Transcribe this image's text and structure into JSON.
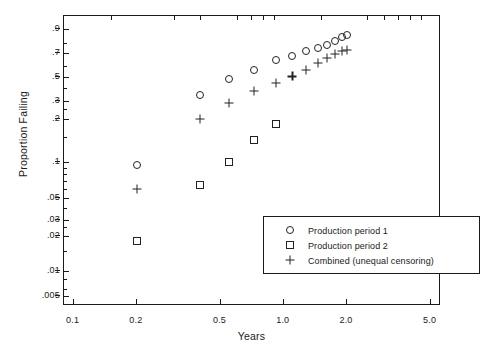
{
  "chart_data": {
    "type": "scatter",
    "title": "",
    "xlabel": "Years",
    "ylabel": "Proportion Failing",
    "xscale": "log",
    "yscale": "log-probability",
    "xlim": [
      0.09,
      5.6
    ],
    "ylim": [
      0.004,
      0.96
    ],
    "grid": false,
    "legend_position": "lower-right-inside",
    "xticks": [
      "0.1",
      "0.2",
      "0.5",
      "1.0",
      "2.0",
      "5.0"
    ],
    "xtick_values": [
      0.1,
      0.2,
      0.5,
      1.0,
      2.0,
      5.0
    ],
    "yticks": [
      ".9",
      ".7",
      ".5",
      ".3",
      ".2",
      ".1",
      ".05",
      ".03",
      ".02",
      ".01",
      ".005"
    ],
    "ytick_values": [
      0.9,
      0.7,
      0.5,
      0.3,
      0.2,
      0.1,
      0.05,
      0.03,
      0.02,
      0.01,
      0.005
    ],
    "series": [
      {
        "name": "Production period 1",
        "marker": "circle",
        "points": [
          [
            0.2,
            0.095
          ],
          [
            0.4,
            0.35
          ],
          [
            0.55,
            0.48
          ],
          [
            0.72,
            0.56
          ],
          [
            0.92,
            0.645
          ],
          [
            1.1,
            0.68
          ],
          [
            1.28,
            0.72
          ],
          [
            1.45,
            0.755
          ],
          [
            1.6,
            0.785
          ],
          [
            1.75,
            0.82
          ],
          [
            1.9,
            0.855
          ],
          [
            2.0,
            0.865
          ]
        ]
      },
      {
        "name": "Production period 2",
        "marker": "square",
        "points": [
          [
            0.2,
            0.018
          ],
          [
            0.4,
            0.065
          ],
          [
            0.55,
            0.1
          ],
          [
            0.72,
            0.145
          ],
          [
            0.92,
            0.185
          ]
        ]
      },
      {
        "name": "Combined (unequal censoring)",
        "marker": "plus",
        "points": [
          [
            0.2,
            0.06
          ],
          [
            0.4,
            0.2
          ],
          [
            0.55,
            0.29
          ],
          [
            0.72,
            0.38
          ],
          [
            0.92,
            0.45
          ],
          [
            1.1,
            0.505
          ],
          [
            1.28,
            0.565
          ],
          [
            1.45,
            0.625
          ],
          [
            1.6,
            0.66
          ],
          [
            1.75,
            0.695
          ],
          [
            1.9,
            0.72
          ],
          [
            2.0,
            0.73
          ]
        ]
      }
    ]
  },
  "legend": {
    "entries": [
      {
        "marker": "circle",
        "label": "Production period 1"
      },
      {
        "marker": "square",
        "label": "Production period 2"
      },
      {
        "marker": "plus",
        "label": "Combined (unequal censoring)"
      }
    ]
  }
}
